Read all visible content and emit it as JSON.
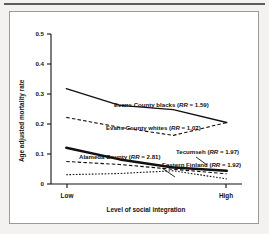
{
  "figure": {
    "background_color": "#f3f2f0",
    "panel_color": "#ffffff",
    "border_color": "#9a9a9a",
    "rule_color": "#5c5c5c"
  },
  "chart_data": {
    "type": "line",
    "title": "",
    "xlabel": "Level of social integration",
    "ylabel": "Age adjusted mortality rate",
    "ylim": [
      0,
      0.5
    ],
    "xlim": [
      0,
      1
    ],
    "grid": false,
    "legend_position": "inline-annotations",
    "yticks": [
      "0",
      "0.1",
      "0.2",
      "0.3",
      "0.4",
      "0.5"
    ],
    "ytick_values": [
      0,
      0.1,
      0.2,
      0.3,
      0.4,
      0.5
    ],
    "xticks": [
      "Low",
      "High"
    ],
    "xtick_values": [
      0.08,
      0.92
    ],
    "x": [
      0.08,
      0.36,
      0.64,
      0.92
    ],
    "series": [
      {
        "name": "Evans County blacks",
        "rr_label": "RR",
        "rr_value": "1.59",
        "annotation": "Evans County blacks (RR = 1.59)",
        "style": "solid-thin",
        "values": [
          0.318,
          0.262,
          0.248,
          0.205
        ]
      },
      {
        "name": "Evans County whites",
        "rr_label": "RR",
        "rr_value": "1.07",
        "annotation": "Evans County whites (RR = 1.07)",
        "style": "dashed",
        "values": [
          0.222,
          0.189,
          0.162,
          0.205
        ]
      },
      {
        "name": "Alameda County",
        "rr_label": "RR",
        "rr_value": "2.81",
        "annotation": "Alameda County (RR = 2.81)",
        "style": "solid-thick",
        "values": [
          0.121,
          0.082,
          0.055,
          0.044
        ]
      },
      {
        "name": "Tecumseh",
        "rr_label": "RR",
        "rr_value": "1.97",
        "annotation": "Tecumseh (RR = 1.97)",
        "style": "dashed",
        "values": [
          0.075,
          0.065,
          0.049,
          0.034
        ]
      },
      {
        "name": "Eastern Finland",
        "rr_label": "RR",
        "rr_value": "1.92",
        "annotation": "Eastern Finland (RR = 1.92)",
        "style": "dotted",
        "values": [
          0.031,
          0.035,
          0.044,
          0.017
        ]
      }
    ]
  }
}
